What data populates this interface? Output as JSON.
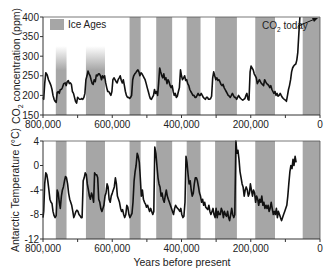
{
  "chart_data": [
    {
      "type": "line",
      "title": "",
      "xlabel": "",
      "ylabel": "CO2 concentration (ppm)",
      "ylabel_main": "CO",
      "ylabel_sub": "2",
      "ylabel_rest": " concentration (ppm)",
      "xlim": [
        800000,
        0
      ],
      "ylim": [
        150,
        400
      ],
      "yticks": [
        150,
        200,
        250,
        300,
        350,
        400
      ],
      "xticks": [
        800000,
        600000,
        400000,
        200000,
        0
      ],
      "xtick_labels": [
        "800,000",
        "600,000",
        "400,000",
        "200,000",
        "0"
      ],
      "legend": {
        "label": "Ice Ages",
        "position": "top-left"
      },
      "annotation": {
        "text_main": "CO",
        "text_sub": "2",
        "text_rest": " today",
        "arrow_to": [
          0,
          400
        ]
      },
      "series": [
        {
          "name": "CO2",
          "x_kyr": [
            800,
            798,
            795,
            792,
            788,
            784,
            780,
            777,
            774,
            771,
            768,
            765,
            762,
            759,
            756,
            753,
            750,
            747,
            744,
            740,
            736,
            733,
            730,
            727,
            724,
            721,
            718,
            715,
            712,
            709,
            706,
            703,
            700,
            697,
            694,
            691,
            688,
            685,
            682,
            679,
            676,
            673,
            670,
            667,
            664,
            661,
            658,
            655,
            652,
            649,
            646,
            643,
            640,
            637,
            634,
            631,
            628,
            625,
            622,
            619,
            616,
            613,
            610,
            607,
            604,
            601,
            598,
            595,
            592,
            589,
            586,
            583,
            580,
            577,
            574,
            571,
            568,
            565,
            562,
            559,
            556,
            553,
            550,
            547,
            544,
            541,
            538,
            535,
            532,
            529,
            526,
            523,
            520,
            517,
            514,
            511,
            508,
            505,
            502,
            499,
            496,
            493,
            490,
            487,
            484,
            481,
            478,
            475,
            472,
            469,
            466,
            463,
            460,
            457,
            454,
            451,
            448,
            445,
            442,
            439,
            436,
            433,
            430,
            427,
            424,
            421,
            418,
            415,
            412,
            409,
            406,
            403,
            400,
            397,
            394,
            391,
            388,
            385,
            382,
            379,
            376,
            373,
            370,
            367,
            364,
            361,
            358,
            355,
            352,
            349,
            346,
            343,
            340,
            337,
            334,
            331,
            328,
            325,
            322,
            319,
            316,
            313,
            310,
            307,
            304,
            301,
            298,
            295,
            292,
            289,
            286,
            283,
            280,
            277,
            274,
            271,
            268,
            265,
            262,
            259,
            256,
            253,
            250,
            247,
            244,
            241,
            238,
            235,
            232,
            229,
            226,
            223,
            220,
            217,
            214,
            211,
            208,
            205,
            202,
            199,
            196,
            193,
            190,
            187,
            184,
            181,
            178,
            175,
            172,
            169,
            166,
            163,
            160,
            157,
            154,
            151,
            148,
            145,
            142,
            139,
            136,
            133,
            130,
            127,
            124,
            121,
            118,
            115,
            112,
            109,
            106,
            103,
            100,
            97,
            94,
            91,
            88,
            85,
            82,
            79,
            76,
            73,
            70,
            67,
            64,
            61,
            58,
            55,
            52,
            49,
            46,
            43,
            40,
            37,
            34,
            31,
            28,
            25,
            22,
            19,
            16,
            13,
            10,
            7,
            4,
            1,
            0
          ],
          "ppm": [
            195,
            190,
            230,
            258,
            252,
            240,
            232,
            225,
            215,
            200,
            190,
            185,
            182,
            208,
            210,
            205,
            215,
            215,
            220,
            230,
            232,
            225,
            235,
            238,
            230,
            232,
            228,
            210,
            205,
            195,
            185,
            180,
            195,
            192,
            190,
            190,
            192,
            190,
            195,
            205,
            240,
            250,
            262,
            255,
            250,
            240,
            230,
            228,
            240,
            235,
            252,
            250,
            255,
            255,
            250,
            240,
            250,
            245,
            250,
            232,
            220,
            210,
            210,
            205,
            200,
            210,
            240,
            245,
            240,
            235,
            232,
            240,
            245,
            250,
            238,
            232,
            240,
            225,
            210,
            200,
            195,
            195,
            192,
            195,
            200,
            240,
            250,
            255,
            258,
            262,
            265,
            260,
            250,
            258,
            255,
            250,
            245,
            240,
            230,
            220,
            210,
            200,
            192,
            190,
            195,
            200,
            215,
            205,
            210,
            200,
            230,
            270,
            260,
            250,
            245,
            255,
            240,
            245,
            230,
            240,
            235,
            225,
            220,
            225,
            210,
            200,
            205,
            195,
            198,
            210,
            220,
            265,
            250,
            240,
            245,
            250,
            238,
            240,
            230,
            225,
            215,
            210,
            205,
            200,
            200,
            195,
            195,
            200,
            205,
            200,
            200,
            205,
            200,
            195,
            192,
            190,
            195,
            195,
            190,
            190,
            192,
            198,
            245,
            260,
            250,
            240,
            245,
            238,
            240,
            235,
            228,
            225,
            228,
            220,
            215,
            210,
            205,
            200,
            198,
            195,
            200,
            205,
            200,
            195,
            195,
            190,
            195,
            200,
            195,
            192,
            190,
            188,
            190,
            192,
            200,
            205,
            190,
            188,
            260,
            275,
            270,
            265,
            255,
            250,
            245,
            230,
            235,
            240,
            235,
            230,
            228,
            225,
            240,
            235,
            230,
            228,
            225,
            220,
            225,
            215,
            210,
            205,
            210,
            200,
            205,
            198,
            200,
            205,
            200,
            195,
            192,
            190,
            188,
            185,
            200,
            215,
            225,
            240,
            260,
            270,
            275,
            278,
            280,
            290,
            310,
            360,
            400
          ],
          "color": "#111111"
        }
      ]
    },
    {
      "type": "line",
      "title": "",
      "xlabel": "Years before present",
      "ylabel": "Antarctic Temperature (°C)",
      "xlim": [
        800000,
        0
      ],
      "ylim": [
        -12,
        4
      ],
      "yticks": [
        -12,
        -8,
        -4,
        0,
        4
      ],
      "xticks": [
        800000,
        600000,
        400000,
        200000,
        0
      ],
      "xtick_labels": [
        "800,000",
        "600,000",
        "400,000",
        "200,000",
        "0"
      ],
      "series": [
        {
          "name": "Antarctic Temperature",
          "x_kyr": [
            800,
            798,
            795,
            792,
            789,
            786,
            783,
            780,
            777,
            774,
            771,
            768,
            765,
            762,
            759,
            756,
            753,
            750,
            747,
            744,
            741,
            738,
            735,
            732,
            729,
            726,
            723,
            720,
            717,
            714,
            711,
            708,
            705,
            702,
            699,
            696,
            693,
            690,
            687,
            684,
            681,
            678,
            675,
            672,
            669,
            666,
            663,
            660,
            657,
            654,
            651,
            648,
            645,
            642,
            639,
            636,
            633,
            630,
            627,
            624,
            621,
            618,
            615,
            612,
            609,
            606,
            603,
            600,
            597,
            594,
            591,
            588,
            585,
            582,
            579,
            576,
            573,
            570,
            567,
            564,
            561,
            558,
            555,
            552,
            549,
            546,
            543,
            540,
            537,
            534,
            531,
            528,
            525,
            522,
            519,
            516,
            513,
            510,
            507,
            504,
            501,
            498,
            495,
            492,
            489,
            486,
            483,
            480,
            477,
            474,
            471,
            468,
            465,
            462,
            459,
            456,
            453,
            450,
            447,
            444,
            441,
            438,
            435,
            432,
            429,
            426,
            423,
            420,
            417,
            414,
            411,
            408,
            405,
            402,
            399,
            396,
            393,
            390,
            387,
            384,
            381,
            378,
            375,
            372,
            369,
            366,
            363,
            360,
            357,
            354,
            351,
            348,
            345,
            342,
            339,
            336,
            333,
            330,
            327,
            324,
            321,
            318,
            315,
            312,
            309,
            306,
            303,
            300,
            297,
            294,
            291,
            288,
            285,
            282,
            279,
            276,
            273,
            270,
            267,
            264,
            261,
            258,
            255,
            252,
            249,
            246,
            243,
            240,
            237,
            234,
            231,
            228,
            225,
            222,
            219,
            216,
            213,
            210,
            207,
            204,
            201,
            198,
            195,
            192,
            189,
            186,
            183,
            180,
            177,
            174,
            171,
            168,
            165,
            162,
            159,
            156,
            153,
            150,
            147,
            144,
            141,
            138,
            135,
            132,
            129,
            126,
            123,
            120,
            117,
            114,
            111,
            108,
            105,
            102,
            99,
            96,
            93,
            90,
            87,
            84,
            81,
            78,
            75,
            72,
            69,
            66,
            63,
            60,
            57,
            54,
            51,
            48,
            45,
            42,
            39,
            36,
            33,
            30,
            27,
            24,
            21,
            18,
            15,
            12,
            9,
            6,
            3,
            1,
            0
          ],
          "temp": [
            -8.5,
            -7.5,
            -3,
            -1.2,
            -1.5,
            -2.5,
            -4,
            -5.5,
            -6,
            -6.2,
            -7.5,
            -8.2,
            -8.5,
            -8.2,
            -4,
            -4.5,
            -6,
            -7,
            -5,
            -4,
            -3.5,
            -2.5,
            -1.8,
            -2,
            -3,
            -4.5,
            -5.5,
            -6,
            -6.5,
            -7.5,
            -8.5,
            -8,
            -7.5,
            -7.3,
            -7.5,
            -8,
            -8.2,
            -8.5,
            -8.5,
            -2.5,
            -2,
            -1.2,
            -1.5,
            -3,
            -4,
            -5,
            -5.5,
            -4.5,
            -5,
            -6,
            -1.2,
            -1.5,
            -1.5,
            -2,
            -5.5,
            -6,
            -7,
            -7.5,
            -7,
            -6.5,
            -5,
            -4.5,
            -3,
            -3.5,
            -5.5,
            -6,
            -5,
            -4.5,
            -4,
            -3.5,
            -2,
            -3,
            -5,
            -5.5,
            -6,
            -7,
            -7.5,
            -7.2,
            -8,
            -8.5,
            -8,
            -6.5,
            -6.8,
            -8,
            -8.5,
            -8.2,
            -7.8,
            -6,
            -2.5,
            -1,
            0,
            2,
            1.5,
            0.5,
            -2,
            -5,
            -4,
            -5.5,
            -6,
            -6.3,
            -6.8,
            -6.5,
            -7,
            -7.5,
            -7,
            -7.5,
            -8,
            -7.5,
            3,
            2,
            0,
            -2,
            -3,
            -3.5,
            -5,
            -4.5,
            -5.5,
            -6,
            -5,
            -4,
            -5,
            -5.5,
            -6,
            -6.5,
            -7,
            -7.5,
            -8,
            -7,
            -6.5,
            -6.8,
            -7,
            -7.2,
            -7.5,
            -7,
            -8,
            -8.5,
            -8.3,
            -6,
            1.5,
            0.5,
            -1.5,
            -3,
            -2.5,
            -4,
            -5,
            -4.5,
            -3,
            -2,
            -2,
            -2.5,
            -3.5,
            -4.5,
            -5,
            -6,
            -5.5,
            -6.5,
            -6,
            -6.8,
            -7,
            -7.2,
            -6.5,
            -7.5,
            -8,
            -7.5,
            -7,
            -8,
            -8.5,
            -7,
            -8.5,
            -7.5,
            -8,
            -8,
            -7,
            -7.5,
            -8.5,
            -7.5,
            -8,
            -8.3,
            -7.5,
            -8.5,
            -9,
            -8,
            -7,
            -8,
            -8.5,
            -8,
            4,
            2,
            2.5,
            1,
            -1,
            -2,
            -3,
            -3.5,
            -5,
            -4,
            -3.5,
            -4,
            -5,
            -4.5,
            -3,
            -4,
            -5,
            -4,
            -4.5,
            -6,
            -5,
            -5.5,
            -6.5,
            -5.5,
            -6,
            -5,
            -6.5,
            -6,
            -7,
            -6.5,
            -7,
            -6.5,
            -7.5,
            -7,
            -6,
            -7,
            -8,
            -7.5,
            -8,
            -7,
            -8.5,
            -7.5,
            -8,
            -8.5,
            -9,
            -8.5,
            -8,
            -7.5,
            -7,
            -6.5,
            -5,
            -3,
            -1,
            0,
            -0.5,
            1,
            0,
            1.5,
            0.5
          ],
          "color": "#111111"
        }
      ]
    }
  ],
  "ice_ages_kyr": [
    [
      763,
      732
    ],
    [
      676,
      621
    ],
    [
      550,
      518
    ],
    [
      473,
      427
    ],
    [
      385,
      345
    ],
    [
      303,
      240
    ],
    [
      187,
      130
    ],
    [
      50,
      0
    ]
  ],
  "labels": {
    "xaxis_title": "Years before present",
    "top_ylabel": "CO2 concentration (ppm)",
    "bottom_ylabel": "Antarctic Temperature (°C)",
    "legend": "Ice Ages",
    "annotation": "CO2 today"
  },
  "colors": {
    "band": "#a6a6a6",
    "line": "#111111",
    "axis": "#333333"
  }
}
